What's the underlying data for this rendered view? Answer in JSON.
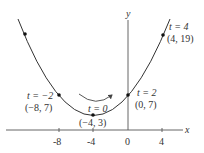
{
  "diagram": {
    "type": "parametric-curve",
    "equations": {
      "x": "2t - 4",
      "y": "t^2 + 3"
    },
    "axes": {
      "x_label": "x",
      "y_label": "y",
      "x_ticks": [
        "-8",
        "-4",
        "0",
        "4"
      ]
    },
    "points": [
      {
        "t_label": "t = −2",
        "coord_label": "(−8, 7)",
        "x": -8,
        "y": 7
      },
      {
        "t_label": "t = 0",
        "coord_label": "(−4, 3)",
        "x": -4,
        "y": 3
      },
      {
        "t_label": "t = 2",
        "coord_label": "(0, 7)",
        "x": 0,
        "y": 7
      },
      {
        "t_label": "t = 4",
        "coord_label": "(4, 19)",
        "x": 4,
        "y": 19
      }
    ],
    "direction_arrow": "left-to-right"
  }
}
